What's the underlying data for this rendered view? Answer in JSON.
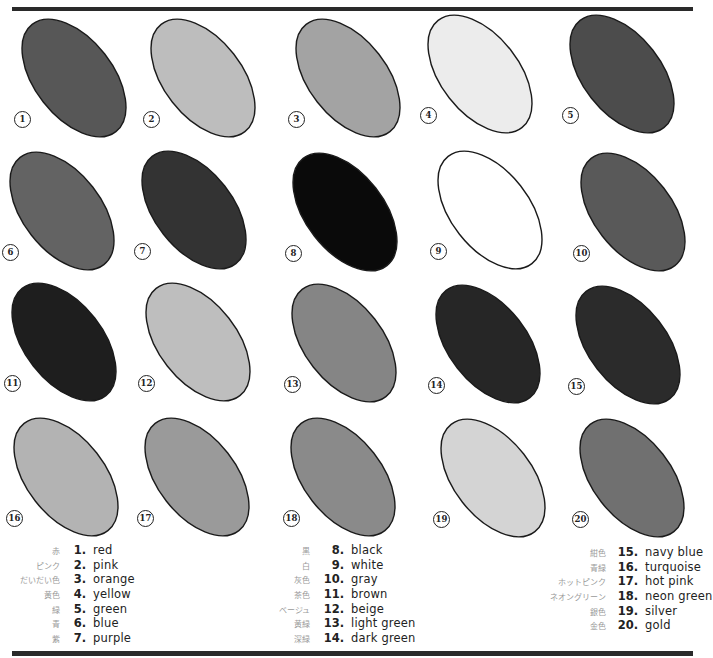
{
  "swatches": [
    {
      "n": "1",
      "name": "red",
      "fill": "#575757",
      "cx": 74,
      "cy": 78
    },
    {
      "n": "2",
      "name": "pink",
      "fill": "#bdbdbd",
      "cx": 203,
      "cy": 78
    },
    {
      "n": "3",
      "name": "orange",
      "fill": "#a3a3a3",
      "cx": 348,
      "cy": 78
    },
    {
      "n": "4",
      "name": "yellow",
      "fill": "#ececec",
      "cx": 480,
      "cy": 74
    },
    {
      "n": "5",
      "name": "green",
      "fill": "#4c4c4c",
      "cx": 622,
      "cy": 74
    },
    {
      "n": "6",
      "name": "blue",
      "fill": "#636363",
      "cx": 62,
      "cy": 211
    },
    {
      "n": "7",
      "name": "purple",
      "fill": "#333333",
      "cx": 194,
      "cy": 210
    },
    {
      "n": "8",
      "name": "black",
      "fill": "#0a0a0a",
      "cx": 345,
      "cy": 212
    },
    {
      "n": "9",
      "name": "white",
      "fill": "#ffffff",
      "cx": 490,
      "cy": 210
    },
    {
      "n": "10",
      "name": "gray",
      "fill": "#595959",
      "cx": 633,
      "cy": 212
    },
    {
      "n": "11",
      "name": "brown",
      "fill": "#1e1e1e",
      "cx": 64,
      "cy": 342
    },
    {
      "n": "12",
      "name": "beige",
      "fill": "#bebebe",
      "cx": 198,
      "cy": 342
    },
    {
      "n": "13",
      "name": "light green",
      "fill": "#858585",
      "cx": 344,
      "cy": 343
    },
    {
      "n": "14",
      "name": "dark green",
      "fill": "#262626",
      "cx": 488,
      "cy": 344
    },
    {
      "n": "15",
      "name": "navy blue",
      "fill": "#2b2b2b",
      "cx": 628,
      "cy": 345
    },
    {
      "n": "16",
      "name": "turquoise",
      "fill": "#b3b3b3",
      "cx": 66,
      "cy": 477
    },
    {
      "n": "17",
      "name": "hot pink",
      "fill": "#9a9a9a",
      "cx": 197,
      "cy": 477
    },
    {
      "n": "18",
      "name": "neon green",
      "fill": "#8a8a8a",
      "cx": 343,
      "cy": 477
    },
    {
      "n": "19",
      "name": "silver",
      "fill": "#d4d4d4",
      "cx": 493,
      "cy": 478
    },
    {
      "n": "20",
      "name": "gold",
      "fill": "#707070",
      "cx": 632,
      "cy": 478
    }
  ],
  "legend": [
    [
      {
        "jp": "赤",
        "num": "1.",
        "en": "red"
      },
      {
        "jp": "ピンク",
        "num": "2.",
        "en": "pink"
      },
      {
        "jp": "だいだい色",
        "num": "3.",
        "en": "orange"
      },
      {
        "jp": "黄色",
        "num": "4.",
        "en": "yellow"
      },
      {
        "jp": "緑",
        "num": "5.",
        "en": "green"
      },
      {
        "jp": "青",
        "num": "6.",
        "en": "blue"
      },
      {
        "jp": "紫",
        "num": "7.",
        "en": "purple"
      }
    ],
    [
      {
        "jp": "黒",
        "num": "8.",
        "en": "black"
      },
      {
        "jp": "白",
        "num": "9.",
        "en": "white"
      },
      {
        "jp": "灰色",
        "num": "10.",
        "en": "gray"
      },
      {
        "jp": "茶色",
        "num": "11.",
        "en": "brown"
      },
      {
        "jp": "ベージュ",
        "num": "12.",
        "en": "beige"
      },
      {
        "jp": "黄緑",
        "num": "13.",
        "en": "light green"
      },
      {
        "jp": "深緑",
        "num": "14.",
        "en": "dark green"
      }
    ],
    [
      {
        "jp": "紺色",
        "num": "15.",
        "en": "navy blue"
      },
      {
        "jp": "青緑",
        "num": "16.",
        "en": "turquoise"
      },
      {
        "jp": "ホットピンク",
        "num": "17.",
        "en": "hot pink"
      },
      {
        "jp": "ネオングリーン",
        "num": "18.",
        "en": "neon green"
      },
      {
        "jp": "銀色",
        "num": "19.",
        "en": "silver"
      },
      {
        "jp": "金色",
        "num": "20.",
        "en": "gold"
      }
    ]
  ]
}
